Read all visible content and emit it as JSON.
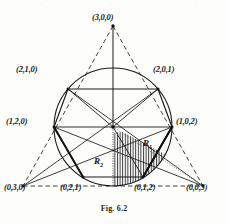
{
  "figure": {
    "caption": "Fig. 6.2",
    "line_color": "#1a1a1a",
    "dashed_color": "#2b2b2b",
    "hatch_color": "#3a3a3a",
    "background": "#fdfdfb"
  },
  "vertex_labels": [
    {
      "id": "v-300",
      "text": "(3,0,0)",
      "x": 92,
      "y": 12
    },
    {
      "id": "v-210",
      "text": "(2,1,0)",
      "x": 16,
      "y": 64
    },
    {
      "id": "v-201",
      "text": "(2,0,1)",
      "x": 153,
      "y": 64
    },
    {
      "id": "v-120",
      "text": "(1,2,0)",
      "x": 6,
      "y": 116
    },
    {
      "id": "v-102",
      "text": "(1,0,2)",
      "x": 176,
      "y": 116
    },
    {
      "id": "v-030",
      "text": "(0,3,0)",
      "x": 4,
      "y": 182
    },
    {
      "id": "v-021",
      "text": "(0,2,1)",
      "x": 60,
      "y": 182
    },
    {
      "id": "v-012",
      "text": "(0,1,2)",
      "x": 134,
      "y": 182
    },
    {
      "id": "v-003",
      "text": "(0,0,3)",
      "x": 186,
      "y": 182
    }
  ],
  "region_labels": [
    {
      "id": "region-r1",
      "base": "R",
      "sub": "1",
      "x": 143,
      "y": 138
    },
    {
      "id": "region-r2",
      "base": "R",
      "sub": "2",
      "x": 94,
      "y": 156
    }
  ],
  "geometry": {
    "triangle_vertices": "(3,0,0) apex, (0,3,0) bottom-left, (0,0,3) bottom-right",
    "circle_center_x": 113,
    "circle_center_y": 127,
    "circle_radius": 59,
    "hexagon_vertices": [
      "(2,1,0)",
      "(2,0,1)",
      "(1,0,2)",
      "(0,1,2)",
      "(0,2,1)",
      "(1,2,0)"
    ]
  },
  "ghost_marks": [
    {
      "text": "·",
      "x": 40
    },
    {
      "text": "·",
      "x": 110
    },
    {
      "text": "·",
      "x": 195
    }
  ]
}
